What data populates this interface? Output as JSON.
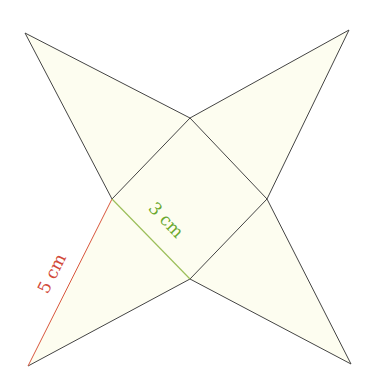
{
  "diagram": {
    "title": "",
    "type": "square pyramid net",
    "colors": {
      "fill": "#fdfdf0",
      "stroke": "#444444",
      "slant_edge": "#d9573f",
      "base_edge": "#7fb03a",
      "slant_label": "#d24a3a",
      "base_label": "#6aa82e",
      "background": "#ffffff"
    },
    "square_base": {
      "top": [
        190,
        118
      ],
      "right": [
        267,
        199
      ],
      "bottom": [
        190,
        279
      ],
      "left": [
        112,
        199
      ]
    },
    "apexes": {
      "top_left": [
        25,
        33
      ],
      "top_right": [
        349,
        30
      ],
      "bottom_right": [
        351,
        364
      ],
      "bottom_left": [
        28,
        366
      ]
    },
    "labels": {
      "base_edge": "3 cm",
      "slant_edge": "5 cm"
    }
  }
}
